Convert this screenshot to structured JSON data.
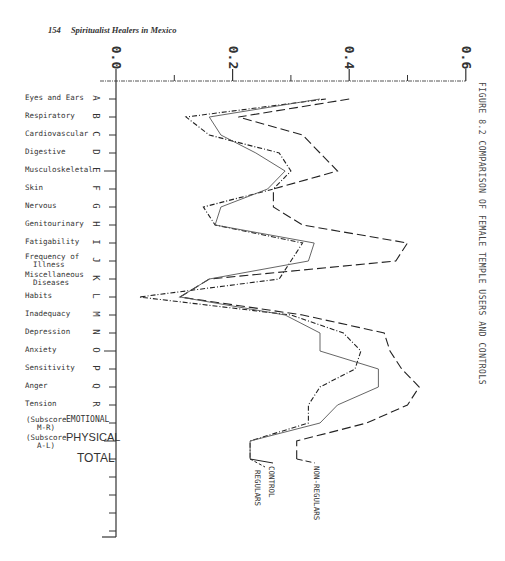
{
  "page": {
    "page_number": "154",
    "running_head": "Spiritualist Healers in Mexico",
    "figure_title": "FIGURE 8.2     COMPARISON OF FEMALE TEMPLE USERS AND CONTROLS"
  },
  "axis": {
    "ticks": [
      "0.0",
      "0.2",
      "0.4",
      "0.6"
    ]
  },
  "categories": [
    {
      "letter": "A",
      "label": "Eyes and Ears"
    },
    {
      "letter": "B",
      "label": "Respiratory"
    },
    {
      "letter": "C",
      "label": "Cardiovascular"
    },
    {
      "letter": "D",
      "label": "Digestive"
    },
    {
      "letter": "E",
      "label": "Musculoskeletal"
    },
    {
      "letter": "F",
      "label": "Skin"
    },
    {
      "letter": "G",
      "label": "Nervous"
    },
    {
      "letter": "H",
      "label": "Genitourinary"
    },
    {
      "letter": "I",
      "label": "Fatigability"
    },
    {
      "letter": "J",
      "label": "Frequency  of",
      "label2": "Illness"
    },
    {
      "letter": "K",
      "label": "Miscellaneous",
      "label2": "Diseases"
    },
    {
      "letter": "L",
      "label": "Habits"
    },
    {
      "letter": "M",
      "label": "Inadequacy"
    },
    {
      "letter": "N",
      "label": "Depression"
    },
    {
      "letter": "O",
      "label": "Anxiety"
    },
    {
      "letter": "P",
      "label": "Sensitivity"
    },
    {
      "letter": "Q",
      "label": "Anger"
    },
    {
      "letter": "R",
      "label": "Tension"
    }
  ],
  "subscores": [
    {
      "prefix": "(Subscore",
      "sub": "M-R)",
      "label": "EMOTIONAL"
    },
    {
      "prefix": "(Subscore",
      "sub": "A-L)",
      "label": "PHYSICAL"
    },
    {
      "label": "TOTAL"
    }
  ],
  "legend": {
    "regulars": "REGULARS",
    "control": "CONTROL",
    "non_regulars": "NON-REGULARS"
  },
  "chart_data": {
    "type": "line",
    "orientation": "horizontal-value-axis",
    "title": "FIGURE 8.2 COMPARISON OF FEMALE TEMPLE USERS AND CONTROLS",
    "xlabel": "",
    "ylabel": "",
    "xlim": [
      0.0,
      0.6
    ],
    "tick_labels": [
      "0.0",
      "0.2",
      "0.4",
      "0.6"
    ],
    "grid": false,
    "categories": [
      "Eyes and Ears",
      "Respiratory",
      "Cardiovascular",
      "Digestive",
      "Musculoskeletal",
      "Skin",
      "Nervous",
      "Genitourinary",
      "Fatigability",
      "Frequency of Illness",
      "Miscellaneous Diseases",
      "Habits",
      "Inadequacy",
      "Depression",
      "Anxiety",
      "Sensitivity",
      "Anger",
      "Tension",
      "EMOTIONAL (Subscore M-R)",
      "PHYSICAL (Subscore A-L)",
      "TOTAL"
    ],
    "series": [
      {
        "name": "NON-REGULARS",
        "style": "long-dash",
        "values": [
          0.4,
          0.21,
          0.32,
          0.35,
          0.38,
          0.27,
          0.27,
          0.32,
          0.5,
          0.48,
          0.16,
          0.11,
          0.32,
          0.46,
          0.47,
          0.49,
          0.52,
          0.5,
          0.43,
          0.31,
          0.31
        ]
      },
      {
        "name": "CONTROL",
        "style": "dash-dot",
        "values": [
          0.36,
          0.12,
          0.16,
          0.28,
          0.3,
          0.27,
          0.15,
          0.17,
          0.32,
          0.3,
          0.28,
          0.04,
          0.3,
          0.39,
          0.42,
          0.41,
          0.35,
          0.33,
          0.33,
          0.23,
          0.23
        ]
      },
      {
        "name": "REGULARS",
        "style": "solid",
        "values": [
          0.35,
          0.16,
          0.18,
          0.24,
          0.29,
          0.26,
          0.18,
          0.17,
          0.34,
          0.33,
          0.16,
          0.11,
          0.29,
          0.35,
          0.35,
          0.45,
          0.45,
          0.38,
          0.35,
          0.23,
          0.23
        ]
      }
    ]
  }
}
